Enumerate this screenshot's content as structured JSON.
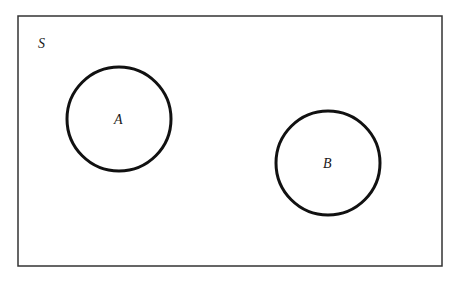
{
  "diagram": {
    "type": "venn",
    "universe": {
      "label": "S",
      "x": 18,
      "y": 16,
      "width": 424,
      "height": 250
    },
    "sets": [
      {
        "label": "A",
        "cx": 119,
        "cy": 119,
        "r": 52
      },
      {
        "label": "B",
        "cx": 328,
        "cy": 163,
        "r": 52
      }
    ],
    "relationship": "disjoint",
    "colors": {
      "stroke": "#111111",
      "background": "#ffffff"
    }
  }
}
